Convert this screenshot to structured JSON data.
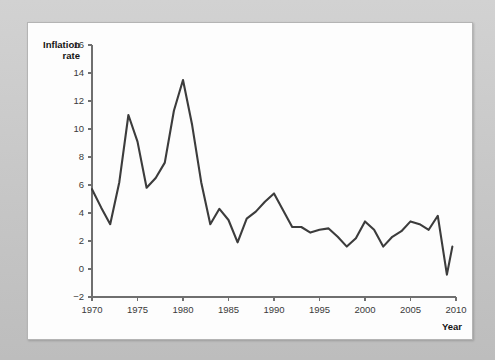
{
  "figure": {
    "background_color": "#c8c8c8",
    "card_color": "#fdfdfd",
    "line_color": "#3c3c3c",
    "axis_color": "#6f6f6f"
  },
  "labels": {
    "y_axis_title_line1": "Inflation",
    "y_axis_title_line2": "rate",
    "x_axis_title": "Year"
  },
  "chart_data": {
    "type": "line",
    "title": "",
    "subtitle": "",
    "xlabel": "Year",
    "ylabel": "Inflation rate",
    "xlim": [
      1970,
      2010
    ],
    "ylim": [
      -2,
      16
    ],
    "xticks": [
      1970,
      1975,
      1980,
      1985,
      1990,
      1995,
      2000,
      2005,
      2010
    ],
    "yticks": [
      -2,
      0,
      2,
      4,
      6,
      8,
      10,
      12,
      14,
      16
    ],
    "xtick_labels": [
      "1970",
      "1975",
      "1980",
      "1985",
      "1990",
      "1995",
      "2000",
      "2005",
      "2010"
    ],
    "ytick_labels": [
      "-2",
      "0",
      "2",
      "4",
      "6",
      "8",
      "10",
      "12",
      "14",
      "16"
    ],
    "grid": false,
    "legend": false,
    "legend_position": "none",
    "markers": false,
    "series": [
      {
        "name": "Inflation rate",
        "color": "#3c3c3c",
        "x": [
          1970,
          1971,
          1972,
          1973,
          1974,
          1975,
          1976,
          1977,
          1978,
          1979,
          1980,
          1981,
          1982,
          1983,
          1984,
          1985,
          1986,
          1987,
          1988,
          1989,
          1990,
          1991,
          1992,
          1993,
          1994,
          1995,
          1996,
          1997,
          1998,
          1999,
          2000,
          2001,
          2002,
          2003,
          2004,
          2005,
          2006,
          2007,
          2008,
          2009
        ],
        "values": [
          5.7,
          4.4,
          3.2,
          6.2,
          11.0,
          9.1,
          5.8,
          6.5,
          7.6,
          11.3,
          13.5,
          10.3,
          6.2,
          3.2,
          4.3,
          3.5,
          1.9,
          3.6,
          4.1,
          4.8,
          5.4,
          4.2,
          3.0,
          3.0,
          2.6,
          2.8,
          2.9,
          2.3,
          1.6,
          2.2,
          3.4,
          2.8,
          1.6,
          2.3,
          2.7,
          3.4,
          3.2,
          2.8,
          3.8,
          -0.4
        ]
      }
    ],
    "final_point": {
      "x": 2009.6,
      "y": 1.6
    }
  }
}
